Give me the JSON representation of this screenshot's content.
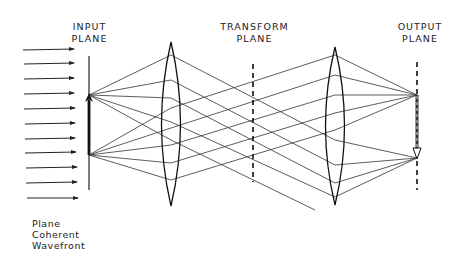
{
  "diagram": {
    "type": "optical-4f-system",
    "labels": {
      "input_plane": [
        "INPUT",
        "PLANE"
      ],
      "transform_plane": [
        "TRANSFORM",
        "PLANE"
      ],
      "output_plane": [
        "OUTPUT",
        "PLANE"
      ],
      "wavefront": [
        "Plane",
        "Coherent",
        "Wavefront"
      ]
    },
    "elements": [
      {
        "name": "incident-arrows",
        "count": 11
      },
      {
        "name": "input-plane",
        "style": "solid",
        "object_arrow": "up"
      },
      {
        "name": "lens-1",
        "type": "convex"
      },
      {
        "name": "transform-plane",
        "style": "dashed"
      },
      {
        "name": "lens-2",
        "type": "convex"
      },
      {
        "name": "output-plane",
        "style": "dashed",
        "image_arrow": "down (inverted)"
      }
    ],
    "colors": {
      "ink": "#222222",
      "background": "#ffffff"
    }
  }
}
